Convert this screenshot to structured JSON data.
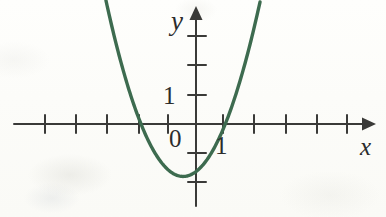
{
  "figure": {
    "kind": "coordinate-plane-parabola",
    "background_color": "#fdfdfa",
    "ink_color": "#2c2c2c",
    "curve_color": "#3d6b4f"
  },
  "labels": {
    "y_axis": "y",
    "x_axis": "x",
    "origin": "0",
    "x_unit": "1",
    "y_unit": "1"
  },
  "chart_data": {
    "type": "line",
    "title": "",
    "subtitle": "",
    "xlabel": "x",
    "ylabel": "y",
    "grid": false,
    "legend": "none",
    "origin_label": "0",
    "axes": {
      "x": {
        "label": "x",
        "arrow": true,
        "xlim": [
          -5.6,
          6.5
        ],
        "tick_values": [
          -5,
          -4,
          -3,
          -2,
          -1,
          1,
          2,
          3,
          4,
          5
        ],
        "labeled_ticks": [
          {
            "value": 1,
            "text": "1"
          }
        ],
        "unit_px": 27.5
      },
      "y": {
        "label": "y",
        "arrow": true,
        "ylim": [
          -3.3,
          4.15
        ],
        "tick_values": [
          -2,
          -1,
          1,
          2,
          3
        ],
        "labeled_ticks": [
          {
            "value": 1,
            "text": "1"
          }
        ],
        "unit_px": 29
      }
    },
    "series": [
      {
        "name": "parabola",
        "kind": "quadratic",
        "color": "#3d6b4f",
        "equation": "y = 0.77(x + 0.47)^2 - 1.81",
        "coefficients": {
          "a": 0.77,
          "b": 0.72,
          "c": -1.64
        },
        "vertex": [
          -0.47,
          -1.81
        ],
        "roots": [
          -2.2,
          1.0
        ],
        "y_intercept": -1.64,
        "x": [
          -2.65,
          -2.4,
          -2.2,
          -2.0,
          -1.75,
          -1.5,
          -1.25,
          -1.0,
          -0.75,
          -0.47,
          -0.25,
          0,
          0.25,
          0.5,
          0.75,
          1.0,
          1.25,
          1.5,
          1.75,
          2.0,
          2.25,
          2.45
        ],
        "y": [
          2.05,
          1.14,
          0.46,
          -0.12,
          -0.74,
          -1.21,
          -1.54,
          -1.71,
          -1.76,
          -1.81,
          -1.74,
          -1.64,
          -1.35,
          -0.97,
          -0.51,
          0.0,
          0.62,
          1.31,
          2.09,
          2.95,
          3.9,
          4.6
        ]
      }
    ]
  }
}
